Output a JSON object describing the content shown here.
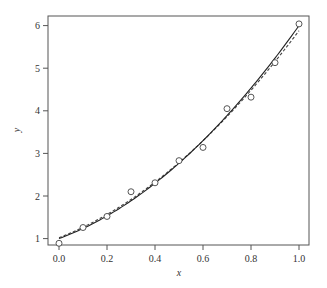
{
  "chart_data": {
    "type": "scatter",
    "title": "",
    "xlabel": "x",
    "ylabel": "y",
    "xlim": [
      -0.03,
      1.04
    ],
    "ylim": [
      0.82,
      6.22
    ],
    "x_ticks": [
      0.0,
      0.2,
      0.4,
      0.6,
      0.8,
      1.0
    ],
    "x_tick_labels": [
      "0.0",
      "0.2",
      "0.4",
      "0.6",
      "0.8",
      "1.0"
    ],
    "y_ticks": [
      1,
      2,
      3,
      4,
      5,
      6
    ],
    "y_tick_labels": [
      "1",
      "2",
      "3",
      "4",
      "5",
      "6"
    ],
    "grid": false,
    "legend": null,
    "series": [
      {
        "name": "observations",
        "style": "open-circle",
        "x": [
          0.0,
          0.1,
          0.2,
          0.3,
          0.4,
          0.5,
          0.6,
          0.7,
          0.8,
          0.9,
          1.0
        ],
        "y": [
          0.89,
          1.26,
          1.52,
          2.1,
          2.31,
          2.83,
          3.14,
          4.05,
          4.32,
          5.13,
          6.04
        ]
      },
      {
        "name": "fit-solid",
        "style": "solid-line",
        "coeffs_quadratic": [
          1.0,
          2.08,
          2.92
        ]
      },
      {
        "name": "fit-dashed",
        "style": "dashed-line",
        "coeffs_quadratic": [
          1.02,
          2.2,
          2.66
        ]
      }
    ]
  },
  "colors": {
    "frame": "#555555",
    "points": "#444444",
    "solid_line": "#222222",
    "dashed_line": "#444444"
  }
}
